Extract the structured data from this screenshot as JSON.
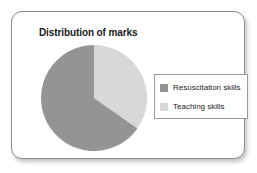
{
  "card": {
    "title": "Distribution of marks"
  },
  "chart_data": {
    "type": "pie",
    "title": "Distribution of marks",
    "categories": [
      "Resuscitation skills",
      "Teaching skills"
    ],
    "values": [
      65,
      35
    ],
    "units": "percent",
    "colors": [
      "#949494",
      "#d8d8d8"
    ],
    "start_angle_deg": 0,
    "direction": "clockwise",
    "legend_position": "right",
    "grid": false,
    "xlabel": "",
    "ylabel": "",
    "slices": [
      {
        "label": "Resuscitation skills",
        "value": 65,
        "color": "#949494",
        "start_angle_deg": 125,
        "end_angle_deg": 360
      },
      {
        "label": "Teaching skills",
        "value": 35,
        "color": "#d8d8d8",
        "start_angle_deg": 0,
        "end_angle_deg": 125
      }
    ]
  },
  "legend": {
    "items": [
      {
        "label": "Resuscitation skills",
        "color": "#949494"
      },
      {
        "label": "Teaching skills",
        "color": "#d8d8d8"
      }
    ]
  }
}
